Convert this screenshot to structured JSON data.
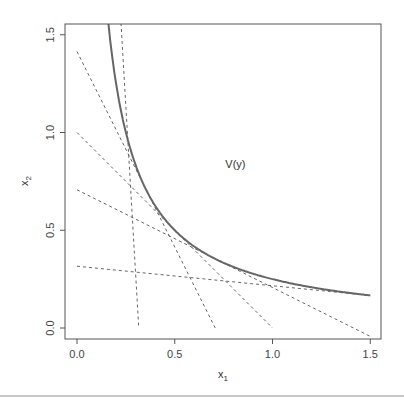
{
  "chart_data": {
    "type": "line",
    "title": "",
    "xlabel": "x₁",
    "ylabel": "x₂",
    "xlim": [
      -0.06,
      1.56
    ],
    "ylim": [
      -0.06,
      1.56
    ],
    "xticks": [
      "0.0",
      "0.5",
      "1.0",
      "1.5"
    ],
    "yticks": [
      "0.0",
      "0.5",
      "1.0",
      "1.5"
    ],
    "grid": false,
    "annotation": {
      "text": "V(y)",
      "x": 0.8,
      "y": 0.85
    },
    "series": [
      {
        "name": "isoquant",
        "style": "solid",
        "function": "x2 = 0.25 / x1",
        "x_range": [
          0.16,
          1.5
        ]
      },
      {
        "name": "tangent-1",
        "style": "dashed",
        "points": [
          [
            0.225,
            1.56
          ],
          [
            0.316,
            0.0
          ]
        ]
      },
      {
        "name": "tangent-2",
        "style": "dashed",
        "points": [
          [
            0.0,
            1.414
          ],
          [
            0.707,
            0.0
          ]
        ]
      },
      {
        "name": "tangent-3",
        "style": "dashed",
        "points": [
          [
            0.0,
            1.0
          ],
          [
            1.0,
            0.0
          ]
        ]
      },
      {
        "name": "tangent-4",
        "style": "dashed",
        "points": [
          [
            0.0,
            0.707
          ],
          [
            1.5,
            -0.043
          ]
        ]
      },
      {
        "name": "tangent-5",
        "style": "dashed",
        "points": [
          [
            0.0,
            0.316
          ],
          [
            1.5,
            0.166
          ]
        ]
      }
    ]
  }
}
